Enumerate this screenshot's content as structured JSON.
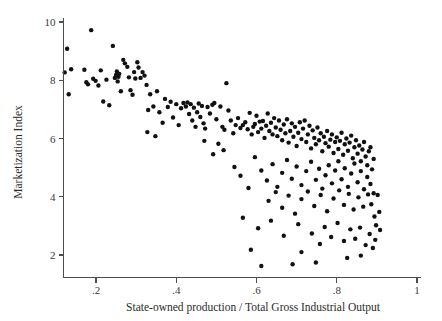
{
  "chart_data": {
    "type": "scatter",
    "title": "",
    "subtitle": "",
    "xlabel": "State-owned production / Total Gross Industrial Output",
    "ylabel": "Marketization Index",
    "xlim": [
      0.11,
      1.02
    ],
    "ylim": [
      1.35,
      10.25
    ],
    "xticks": [
      0.2,
      0.4,
      0.6,
      0.8,
      1
    ],
    "xticklabels": [
      ".2",
      ".4",
      ".6",
      ".8",
      "1"
    ],
    "yticks": [
      2,
      4,
      6,
      8,
      10
    ],
    "yticklabels": [
      "2",
      "4",
      "6",
      "8",
      "10"
    ],
    "grid": false,
    "legend": null,
    "marker": {
      "shape": "circle",
      "color": "#111111",
      "radius_px": 2.2
    },
    "n_points": 232,
    "correlation_sign": "negative",
    "points": [
      [
        0.128,
        9.08
      ],
      [
        0.122,
        8.27
      ],
      [
        0.138,
        8.38
      ],
      [
        0.132,
        7.52
      ],
      [
        0.171,
        8.36
      ],
      [
        0.176,
        7.93
      ],
      [
        0.18,
        7.86
      ],
      [
        0.188,
        9.72
      ],
      [
        0.193,
        8.05
      ],
      [
        0.199,
        7.98
      ],
      [
        0.206,
        7.82
      ],
      [
        0.212,
        8.34
      ],
      [
        0.218,
        7.27
      ],
      [
        0.226,
        8.02
      ],
      [
        0.233,
        7.14
      ],
      [
        0.242,
        9.18
      ],
      [
        0.247,
        8.08
      ],
      [
        0.25,
        8.18
      ],
      [
        0.252,
        8.3
      ],
      [
        0.254,
        7.96
      ],
      [
        0.256,
        8.12
      ],
      [
        0.258,
        8.22
      ],
      [
        0.262,
        7.62
      ],
      [
        0.268,
        8.7
      ],
      [
        0.272,
        8.58
      ],
      [
        0.278,
        8.46
      ],
      [
        0.282,
        8.1
      ],
      [
        0.286,
        7.66
      ],
      [
        0.291,
        7.5
      ],
      [
        0.295,
        8.28
      ],
      [
        0.298,
        8.06
      ],
      [
        0.303,
        8.62
      ],
      [
        0.306,
        8.44
      ],
      [
        0.311,
        8.08
      ],
      [
        0.316,
        8.28
      ],
      [
        0.321,
        8.16
      ],
      [
        0.326,
        7.84
      ],
      [
        0.33,
        6.98
      ],
      [
        0.335,
        7.52
      ],
      [
        0.343,
        7.1
      ],
      [
        0.352,
        7.62
      ],
      [
        0.358,
        6.9
      ],
      [
        0.372,
        7.36
      ],
      [
        0.379,
        7.08
      ],
      [
        0.386,
        7.26
      ],
      [
        0.392,
        6.72
      ],
      [
        0.4,
        7.18
      ],
      [
        0.406,
        6.46
      ],
      [
        0.412,
        7.04
      ],
      [
        0.418,
        7.22
      ],
      [
        0.424,
        7.1
      ],
      [
        0.428,
        7.24
      ],
      [
        0.432,
        6.84
      ],
      [
        0.436,
        7.18
      ],
      [
        0.44,
        6.62
      ],
      [
        0.444,
        7.06
      ],
      [
        0.448,
        6.4
      ],
      [
        0.452,
        6.9
      ],
      [
        0.456,
        7.2
      ],
      [
        0.46,
        6.74
      ],
      [
        0.464,
        7.12
      ],
      [
        0.468,
        6.52
      ],
      [
        0.472,
        6.34
      ],
      [
        0.478,
        7.08
      ],
      [
        0.484,
        6.86
      ],
      [
        0.49,
        7.16
      ],
      [
        0.495,
        7.22
      ],
      [
        0.5,
        6.66
      ],
      [
        0.505,
        5.82
      ],
      [
        0.51,
        7.1
      ],
      [
        0.515,
        6.4
      ],
      [
        0.52,
        6.3
      ],
      [
        0.525,
        7.9
      ],
      [
        0.53,
        6.96
      ],
      [
        0.536,
        6.62
      ],
      [
        0.542,
        6.18
      ],
      [
        0.548,
        6.46
      ],
      [
        0.554,
        6.7
      ],
      [
        0.56,
        6.36
      ],
      [
        0.566,
        6.46
      ],
      [
        0.572,
        6.56
      ],
      [
        0.578,
        6.32
      ],
      [
        0.583,
        6.88
      ],
      [
        0.588,
        6.14
      ],
      [
        0.592,
        6.4
      ],
      [
        0.596,
        6.5
      ],
      [
        0.6,
        6.78
      ],
      [
        0.604,
        6.22
      ],
      [
        0.608,
        6.58
      ],
      [
        0.612,
        6.34
      ],
      [
        0.616,
        6.6
      ],
      [
        0.62,
        6.02
      ],
      [
        0.624,
        6.44
      ],
      [
        0.628,
        6.86
      ],
      [
        0.632,
        6.26
      ],
      [
        0.636,
        6.54
      ],
      [
        0.64,
        6.14
      ],
      [
        0.644,
        6.7
      ],
      [
        0.648,
        6.38
      ],
      [
        0.652,
        6.08
      ],
      [
        0.656,
        6.62
      ],
      [
        0.66,
        6.3
      ],
      [
        0.664,
        5.94
      ],
      [
        0.668,
        6.48
      ],
      [
        0.672,
        6.18
      ],
      [
        0.676,
        6.66
      ],
      [
        0.68,
        5.86
      ],
      [
        0.684,
        6.26
      ],
      [
        0.688,
        6.52
      ],
      [
        0.692,
        6.06
      ],
      [
        0.696,
        6.4
      ],
      [
        0.7,
        5.74
      ],
      [
        0.704,
        6.2
      ],
      [
        0.708,
        6.56
      ],
      [
        0.712,
        5.98
      ],
      [
        0.716,
        6.34
      ],
      [
        0.72,
        6.62
      ],
      [
        0.724,
        5.88
      ],
      [
        0.728,
        6.14
      ],
      [
        0.732,
        6.44
      ],
      [
        0.736,
        5.66
      ],
      [
        0.74,
        6.28
      ],
      [
        0.744,
        6.02
      ],
      [
        0.748,
        5.8
      ],
      [
        0.752,
        6.38
      ],
      [
        0.756,
        5.94
      ],
      [
        0.76,
        6.18
      ],
      [
        0.764,
        5.56
      ],
      [
        0.768,
        6.06
      ],
      [
        0.772,
        5.84
      ],
      [
        0.776,
        6.26
      ],
      [
        0.78,
        5.72
      ],
      [
        0.784,
        5.96
      ],
      [
        0.788,
        6.14
      ],
      [
        0.792,
        5.5
      ],
      [
        0.796,
        5.88
      ],
      [
        0.8,
        6.04
      ],
      [
        0.804,
        5.64
      ],
      [
        0.808,
        5.92
      ],
      [
        0.812,
        6.2
      ],
      [
        0.816,
        5.44
      ],
      [
        0.82,
        5.8
      ],
      [
        0.824,
        6.0
      ],
      [
        0.828,
        5.58
      ],
      [
        0.832,
        5.86
      ],
      [
        0.836,
        6.1
      ],
      [
        0.84,
        5.32
      ],
      [
        0.844,
        5.7
      ],
      [
        0.848,
        5.94
      ],
      [
        0.852,
        5.48
      ],
      [
        0.856,
        5.76
      ],
      [
        0.86,
        5.22
      ],
      [
        0.864,
        5.62
      ],
      [
        0.868,
        5.88
      ],
      [
        0.872,
        5.38
      ],
      [
        0.876,
        5.08
      ],
      [
        0.88,
        5.56
      ],
      [
        0.884,
        5.7
      ],
      [
        0.888,
        4.94
      ],
      [
        0.892,
        5.3
      ],
      [
        0.545,
        5.02
      ],
      [
        0.56,
        4.72
      ],
      [
        0.58,
        4.3
      ],
      [
        0.596,
        5.36
      ],
      [
        0.612,
        4.9
      ],
      [
        0.626,
        4.56
      ],
      [
        0.64,
        5.12
      ],
      [
        0.652,
        4.34
      ],
      [
        0.664,
        4.82
      ],
      [
        0.676,
        5.26
      ],
      [
        0.688,
        4.62
      ],
      [
        0.7,
        5.04
      ],
      [
        0.712,
        4.4
      ],
      [
        0.724,
        4.88
      ],
      [
        0.736,
        5.2
      ],
      [
        0.748,
        4.58
      ],
      [
        0.756,
        4.96
      ],
      [
        0.764,
        4.28
      ],
      [
        0.772,
        4.74
      ],
      [
        0.78,
        5.08
      ],
      [
        0.788,
        4.46
      ],
      [
        0.796,
        4.9
      ],
      [
        0.804,
        5.22
      ],
      [
        0.812,
        4.6
      ],
      [
        0.82,
        4.98
      ],
      [
        0.828,
        4.34
      ],
      [
        0.836,
        4.8
      ],
      [
        0.844,
        5.14
      ],
      [
        0.852,
        4.5
      ],
      [
        0.86,
        4.88
      ],
      [
        0.868,
        4.26
      ],
      [
        0.876,
        4.68
      ],
      [
        0.884,
        4.44
      ],
      [
        0.892,
        4.12
      ],
      [
        0.63,
        3.86
      ],
      [
        0.648,
        4.16
      ],
      [
        0.664,
        3.62
      ],
      [
        0.68,
        4.04
      ],
      [
        0.696,
        3.42
      ],
      [
        0.712,
        3.92
      ],
      [
        0.728,
        4.18
      ],
      [
        0.744,
        3.68
      ],
      [
        0.76,
        4.06
      ],
      [
        0.776,
        3.5
      ],
      [
        0.792,
        3.94
      ],
      [
        0.806,
        4.22
      ],
      [
        0.818,
        3.72
      ],
      [
        0.83,
        4.1
      ],
      [
        0.842,
        3.56
      ],
      [
        0.854,
        3.98
      ],
      [
        0.866,
        3.66
      ],
      [
        0.878,
        4.08
      ],
      [
        0.886,
        3.74
      ],
      [
        0.894,
        3.32
      ],
      [
        0.898,
        3.02
      ],
      [
        0.566,
        3.28
      ],
      [
        0.604,
        2.92
      ],
      [
        0.636,
        3.18
      ],
      [
        0.668,
        2.66
      ],
      [
        0.704,
        3.06
      ],
      [
        0.738,
        2.74
      ],
      [
        0.758,
        2.38
      ],
      [
        0.77,
        2.96
      ],
      [
        0.786,
        2.62
      ],
      [
        0.802,
        3.1
      ],
      [
        0.818,
        2.48
      ],
      [
        0.834,
        2.88
      ],
      [
        0.846,
        2.56
      ],
      [
        0.858,
        2.94
      ],
      [
        0.872,
        2.34
      ],
      [
        0.882,
        2.72
      ],
      [
        0.89,
        2.24
      ],
      [
        0.896,
        2.52
      ],
      [
        0.612,
        1.62
      ],
      [
        0.69,
        1.68
      ],
      [
        0.748,
        1.74
      ],
      [
        0.826,
        1.9
      ],
      [
        0.586,
        2.18
      ],
      [
        0.712,
        2.1
      ],
      [
        0.86,
        1.98
      ],
      [
        0.348,
        6.08
      ],
      [
        0.366,
        6.54
      ],
      [
        0.328,
        6.22
      ],
      [
        0.47,
        5.92
      ],
      [
        0.492,
        5.46
      ],
      [
        0.518,
        5.6
      ],
      [
        0.902,
        4.06
      ],
      [
        0.906,
        3.48
      ],
      [
        0.908,
        2.86
      ]
    ]
  }
}
